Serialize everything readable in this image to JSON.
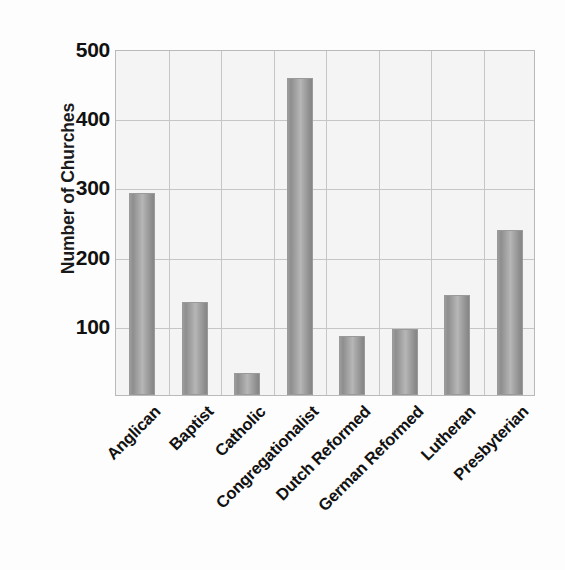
{
  "chart_data": {
    "type": "bar",
    "title": "",
    "xlabel": "",
    "ylabel": "Number of Churches",
    "categories": [
      "Anglican",
      "Baptist",
      "Catholic",
      "Congregationalist",
      "Dutch Reformed",
      "German Reformed",
      "Lutheran",
      "Presbyterian"
    ],
    "values": [
      292,
      134,
      32,
      458,
      85,
      96,
      144,
      239
    ],
    "ylim": [
      0,
      500
    ],
    "yticks": [
      100,
      200,
      300,
      400,
      500
    ],
    "ytick_labels": [
      "100",
      "200",
      "300",
      "400",
      "500"
    ],
    "grid": "both",
    "legend": "none",
    "bar_color": "#a0a0a0",
    "plot_background": "#f4f4f4",
    "gridline_color": "#c6c6c6"
  },
  "axis": {
    "y_title": "Number of Churches"
  }
}
